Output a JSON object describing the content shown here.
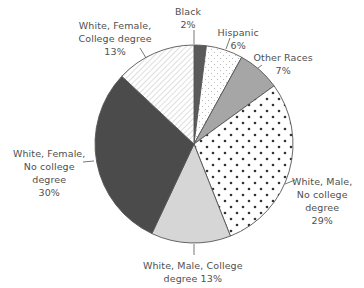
{
  "chart_data": {
    "type": "pie",
    "title": "",
    "start_angle_deg": 0,
    "direction": "clockwise",
    "center": [
      194,
      144
    ],
    "radius": 99,
    "slices": [
      {
        "name": "Black",
        "value": 2,
        "label_lines": [
          "Black",
          "2%"
        ],
        "fill": "#5a5a5a",
        "pattern": "solid",
        "label_pos": [
          188,
          5
        ],
        "leader": [
          [
            194,
            30
          ],
          [
            194,
            44
          ]
        ]
      },
      {
        "name": "Hispanic",
        "value": 6,
        "label_lines": [
          "Hispanic",
          "6%"
        ],
        "fill": "#ffffff",
        "pattern": "fine-dots",
        "label_pos": [
          238,
          26
        ],
        "leader": [
          [
            230,
            38
          ],
          [
            226,
            49
          ]
        ]
      },
      {
        "name": "Other Races",
        "value": 7,
        "label_lines": [
          "Other Races",
          "7%"
        ],
        "fill": "#a6a6a6",
        "pattern": "solid",
        "label_pos": [
          283,
          51
        ],
        "leader": [
          [
            262,
            65
          ],
          [
            258,
            68
          ]
        ]
      },
      {
        "name": "White, Male, No college degree",
        "value": 29,
        "label_lines": [
          "White, Male,",
          "No college",
          "degree",
          "29%"
        ],
        "fill": "#ffffff",
        "pattern": "bold-dots",
        "label_pos": [
          322,
          175
        ],
        "leader": [
          [
            295,
            180
          ],
          [
            285,
            184
          ]
        ]
      },
      {
        "name": "White, Male, College degree",
        "value": 13,
        "label_lines": [
          "White, Male, College",
          "degree 13%"
        ],
        "fill": "#d6d6d6",
        "pattern": "solid",
        "label_pos": [
          193,
          259
        ],
        "leader": [
          [
            194,
            244
          ],
          [
            194,
            255
          ]
        ]
      },
      {
        "name": "White, Female, No college degree",
        "value": 30,
        "label_lines": [
          "White, Female,",
          "No college",
          "degree",
          "30%"
        ],
        "fill": "#4b4b4b",
        "pattern": "solid",
        "label_pos": [
          49,
          147
        ],
        "leader": [
          [
            83,
            162
          ],
          [
            94,
            161
          ]
        ]
      },
      {
        "name": "White, Female, College degree",
        "value": 13,
        "label_lines": [
          "White, Female,",
          "College degree",
          "13%"
        ],
        "fill": "#ffffff",
        "pattern": "diagonal-lines",
        "label_pos": [
          115,
          19
        ],
        "leader": [
          [
            140,
            48
          ],
          [
            146,
            58
          ]
        ]
      }
    ],
    "legend": "none",
    "units": "%"
  },
  "colors": {
    "outline": "#555555",
    "label_text": "#505050",
    "dot_bold": "#333333",
    "dot_fine": "#b8b8b8",
    "hatch": "#9a9a9a"
  }
}
